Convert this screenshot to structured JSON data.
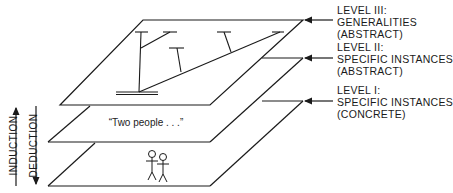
{
  "diagram": {
    "levels": [
      {
        "id": "level-3",
        "title": "LEVEL III:",
        "line1": "GENERALITIES",
        "line2": "(ABSTRACT)"
      },
      {
        "id": "level-2",
        "title": "LEVEL II:",
        "line1": "SPECIFIC INSTANCES",
        "line2": "(ABSTRACT)"
      },
      {
        "id": "level-1",
        "title": "LEVEL I:",
        "line1": "SPECIFIC INSTANCES",
        "line2": "(CONCRETE)"
      }
    ],
    "middle_plane_text": "“Two people . . .”",
    "bottom_plane_content": "two stick figures",
    "top_plane_content": "tree hierarchy",
    "side_arrows": {
      "up": "INDUCTION",
      "down": "DEDUCTION"
    },
    "colors": {
      "line": "#1a1a1a",
      "background": "#ffffff"
    }
  }
}
